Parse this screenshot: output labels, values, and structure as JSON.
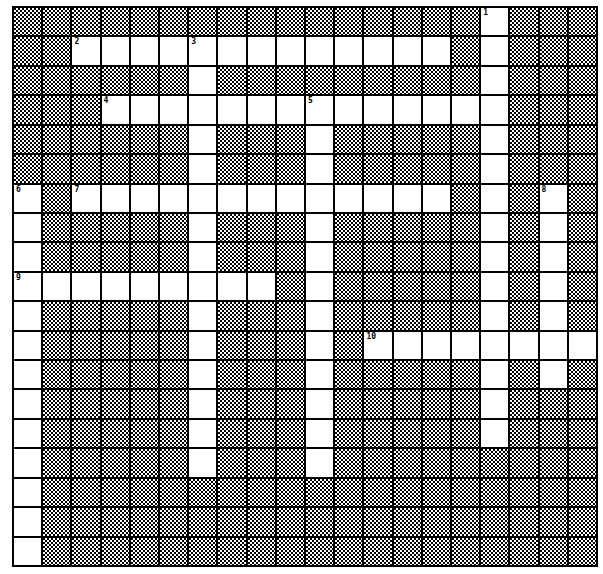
{
  "puzzle": {
    "cols": 20,
    "rows": 19,
    "words": [
      {
        "number": "1",
        "direction": "down",
        "row": 0,
        "col": 16,
        "length": 15
      },
      {
        "number": "2",
        "direction": "across",
        "row": 1,
        "col": 2,
        "length": 13
      },
      {
        "number": "3",
        "direction": "down",
        "row": 1,
        "col": 6,
        "length": 15
      },
      {
        "number": "4",
        "direction": "across",
        "row": 3,
        "col": 3,
        "length": 14
      },
      {
        "number": "5",
        "direction": "down",
        "row": 3,
        "col": 10,
        "length": 13
      },
      {
        "number": "6",
        "direction": "down",
        "row": 6,
        "col": 0,
        "length": 13
      },
      {
        "number": "7",
        "direction": "across",
        "row": 6,
        "col": 2,
        "length": 13
      },
      {
        "number": "8",
        "direction": "down",
        "row": 6,
        "col": 18,
        "length": 7
      },
      {
        "number": "9",
        "direction": "across",
        "row": 9,
        "col": 0,
        "length": 9
      },
      {
        "number": "10",
        "direction": "across",
        "row": 11,
        "col": 12,
        "length": 8
      }
    ]
  }
}
